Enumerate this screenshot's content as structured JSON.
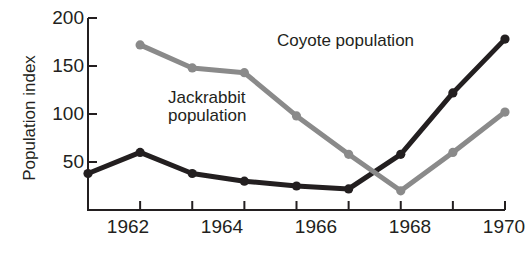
{
  "chart_data": {
    "type": "line",
    "title": "",
    "xlabel": "",
    "ylabel": "Population index",
    "x": [
      1962,
      1963,
      1964,
      1965,
      1966,
      1967,
      1968,
      1969,
      1970
    ],
    "xlim": [
      1961.5,
      1970.6
    ],
    "ylim": [
      0,
      200
    ],
    "xticks": [
      1962,
      1963,
      1964,
      1965,
      1966,
      1967,
      1968,
      1969,
      1970
    ],
    "xtick_labels": [
      "1962",
      "",
      "1964",
      "",
      "1966",
      "",
      "1968",
      "",
      "1970"
    ],
    "yticks": [
      50,
      100,
      150,
      200
    ],
    "ytick_labels": [
      "50",
      "100",
      "150",
      "200"
    ],
    "grid": false,
    "legend": "inline-annotations",
    "series": [
      {
        "name": "Jackrabbit population",
        "color": "#231f20",
        "x": [
          1962,
          1963,
          1964,
          1965,
          1966,
          1967,
          1968,
          1969,
          1970
        ],
        "values": [
          38,
          60,
          38,
          30,
          25,
          22,
          58,
          122,
          178
        ]
      },
      {
        "name": "Coyote population",
        "color": "#8a8a8a",
        "x": [
          1963,
          1964,
          1965,
          1966,
          1967,
          1968,
          1969,
          1970
        ],
        "values": [
          172,
          148,
          143,
          98,
          58,
          20,
          60,
          102
        ]
      }
    ],
    "annotations": [
      {
        "text": "Coyote population",
        "x": 1966.3,
        "y": 185
      },
      {
        "text": "Jackrabbit",
        "x": 1963.6,
        "y": 113
      },
      {
        "text": "population",
        "x": 1963.6,
        "y": 97
      }
    ]
  },
  "axis": {
    "y_label": "Population index",
    "y_tick_200": "200",
    "y_tick_150": "150",
    "y_tick_100": "100",
    "y_tick_50": "50",
    "x_tick_1962": "1962",
    "x_tick_1964": "1964",
    "x_tick_1966": "1966",
    "x_tick_1968": "1968",
    "x_tick_1970": "1970"
  },
  "labels": {
    "coyote": "Coyote population",
    "jackrabbit_line1": "Jackrabbit",
    "jackrabbit_line2": "population"
  }
}
